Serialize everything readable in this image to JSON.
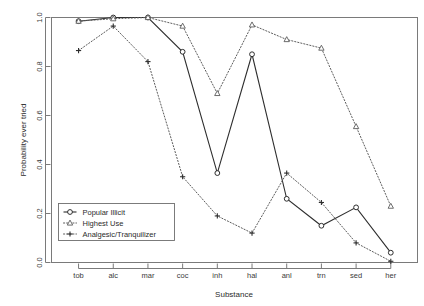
{
  "chart_data": {
    "type": "line",
    "title": "",
    "xlabel": "Substance",
    "ylabel": "Probability ever tried",
    "categories": [
      "tob",
      "alc",
      "mar",
      "coc",
      "inh",
      "hal",
      "anl",
      "trn",
      "sed",
      "her"
    ],
    "ylim": [
      0.0,
      1.0
    ],
    "ytick_labels": [
      "0.0",
      "0.2",
      "0.4",
      "0.6",
      "0.8",
      "1.0"
    ],
    "ytick_values": [
      0.0,
      0.2,
      0.4,
      0.6,
      0.8,
      1.0
    ],
    "grid": false,
    "legend_position": "bottom-left",
    "series": [
      {
        "name": "Popular Illicit",
        "marker": "circle",
        "line_style": "solid",
        "color": "#2e2e2e",
        "values": [
          0.985,
          1.0,
          1.0,
          0.86,
          0.365,
          0.85,
          0.26,
          0.15,
          0.225,
          0.04
        ]
      },
      {
        "name": "Highest Use",
        "marker": "triangle",
        "line_style": "dotted",
        "color": "#5c5c5c",
        "values": [
          0.985,
          0.995,
          1.0,
          0.965,
          0.69,
          0.97,
          0.91,
          0.875,
          0.555,
          0.23
        ]
      },
      {
        "name": "Analgesic/Tranquilizer",
        "marker": "plus",
        "line_style": "dotted",
        "color": "#2e2e2e",
        "values": [
          0.865,
          0.965,
          0.82,
          0.35,
          0.19,
          0.12,
          0.365,
          0.245,
          0.08,
          0.005
        ]
      }
    ]
  }
}
